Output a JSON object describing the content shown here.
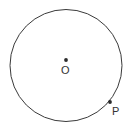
{
  "figure": {
    "type": "circle-with-points",
    "background_color": "#ffffff",
    "stroke_color": "#3a3a3a",
    "text_color": "#333333",
    "canvas": {
      "width": 131,
      "height": 132
    },
    "circle": {
      "name": "circle-outline",
      "center_x": 66,
      "center_y": 65.5,
      "radius": 56,
      "stroke_width": 1,
      "fill": "none"
    },
    "points": [
      {
        "id": "center",
        "label": "O",
        "marker_x": 66,
        "marker_y": 60,
        "marker_radius": 1.9,
        "label_x": 61,
        "label_y": 65,
        "description": "center-point"
      },
      {
        "id": "p",
        "label": "P",
        "marker_x": 110,
        "marker_y": 102,
        "marker_radius": 1.9,
        "label_x": 112,
        "label_y": 106,
        "description": "point-on-circle"
      }
    ]
  }
}
